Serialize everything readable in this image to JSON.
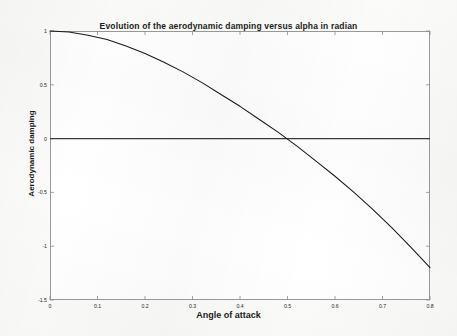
{
  "chart_data": {
    "type": "line",
    "title": "Evolution of the aerodynamic damping versus alpha in radian",
    "xlabel": "Angle of attack",
    "ylabel": "Aerodynamic damping",
    "xlim": [
      0,
      0.8
    ],
    "ylim": [
      -1.5,
      1
    ],
    "grid": false,
    "legend": null,
    "xticks": [
      0,
      0.1,
      0.2,
      0.3,
      0.4,
      0.5,
      0.6,
      0.7,
      0.8
    ],
    "xtick_labels": [
      "0",
      "0.1",
      "0.2",
      "0.3",
      "0.4",
      "0.5",
      "0.6",
      "0.7",
      "0.8"
    ],
    "yticks": [
      1,
      0.5,
      0,
      -0.5,
      -1,
      -1.5
    ],
    "ytick_labels": [
      "1",
      "0.5",
      "0",
      "-0.5",
      "-1",
      "-1.5"
    ],
    "series": [
      {
        "name": "Aerodynamic damping",
        "color": "#1a1a1a",
        "x": [
          0.0,
          0.04,
          0.08,
          0.12,
          0.16,
          0.2,
          0.24,
          0.28,
          0.32,
          0.36,
          0.4,
          0.44,
          0.48,
          0.52,
          0.56,
          0.6,
          0.64,
          0.68,
          0.72,
          0.76,
          0.8
        ],
        "y": [
          1.0,
          0.99,
          0.96,
          0.92,
          0.86,
          0.79,
          0.71,
          0.62,
          0.52,
          0.41,
          0.3,
          0.18,
          0.06,
          -0.07,
          -0.21,
          -0.35,
          -0.5,
          -0.66,
          -0.83,
          -1.01,
          -1.2
        ]
      },
      {
        "name": "zero-reference-line",
        "color": "#3a3a3a",
        "x": [
          0.0,
          0.8
        ],
        "y": [
          0,
          0
        ]
      }
    ],
    "zero_crossing_x": 0.52
  }
}
